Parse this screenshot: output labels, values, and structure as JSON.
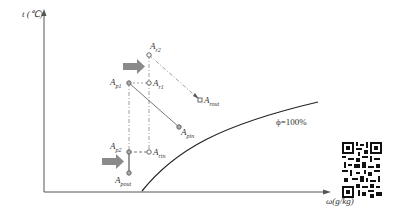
{
  "diagram": {
    "y_axis_label": "t (℃)",
    "x_axis_label": "ω(g/kg)",
    "curve_label": "ϕ=100%",
    "points": [
      {
        "id": "Ar2",
        "base": "A",
        "sub": "r2"
      },
      {
        "id": "Ar1",
        "base": "A",
        "sub": "r1"
      },
      {
        "id": "Ap1",
        "base": "A",
        "sub": "p1"
      },
      {
        "id": "Arout",
        "base": "A",
        "sub": "rout"
      },
      {
        "id": "Apin",
        "base": "A",
        "sub": "pin"
      },
      {
        "id": "Ap2",
        "base": "A",
        "sub": "p2"
      },
      {
        "id": "Arin",
        "base": "A",
        "sub": "rin"
      },
      {
        "id": "Apout",
        "base": "A",
        "sub": "pout"
      }
    ],
    "colors": {
      "axis": "#555555",
      "line": "#777777",
      "arrow": "#888888",
      "curve": "#222222"
    }
  }
}
